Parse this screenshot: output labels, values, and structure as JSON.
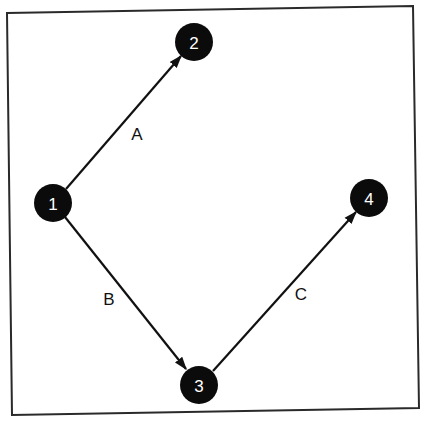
{
  "diagram": {
    "type": "activity-on-arrow network",
    "nodes": [
      {
        "id": "1",
        "label": "1",
        "x": 53,
        "y": 203
      },
      {
        "id": "2",
        "label": "2",
        "x": 194,
        "y": 42
      },
      {
        "id": "3",
        "label": "3",
        "x": 199,
        "y": 385
      },
      {
        "id": "4",
        "label": "4",
        "x": 369,
        "y": 198
      }
    ],
    "edges": [
      {
        "id": "A",
        "label": "A",
        "from": "1",
        "to": "2",
        "label_x": 137,
        "label_y": 134
      },
      {
        "id": "B",
        "label": "B",
        "from": "1",
        "to": "3",
        "label_x": 109,
        "label_y": 299
      },
      {
        "id": "C",
        "label": "C",
        "from": "3",
        "to": "4",
        "label_x": 301,
        "label_y": 294
      }
    ],
    "colors": {
      "node_fill": "#0b0b0b",
      "node_text": "#ffffff",
      "edge": "#111111",
      "frame": "#2a2a2a",
      "background": "#ffffff"
    }
  }
}
